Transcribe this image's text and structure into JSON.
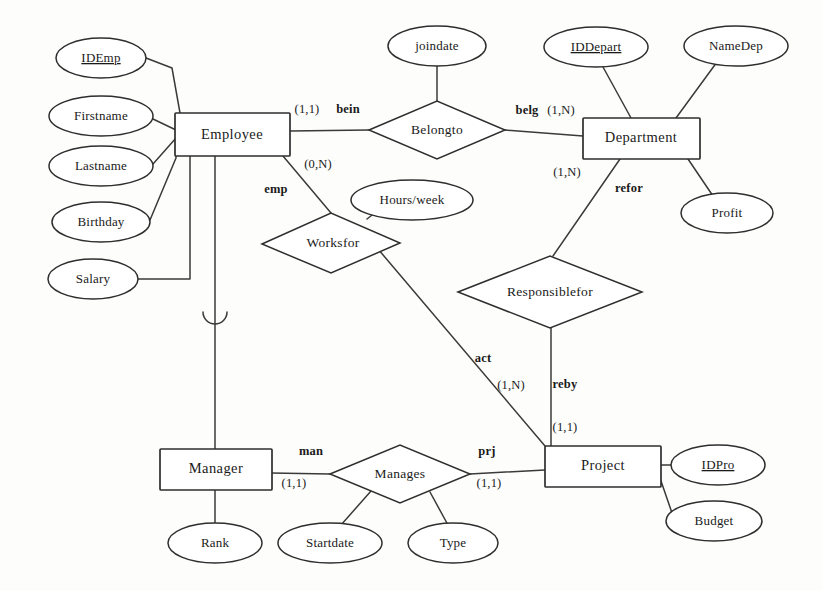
{
  "diagram": {
    "type": "er-diagram",
    "notation": "min-max (Merise style)",
    "entities": [
      {
        "id": "employee",
        "label": "Employee",
        "x": 232,
        "y": 134,
        "w": 116,
        "h": 42
      },
      {
        "id": "department",
        "label": "Department",
        "x": 641,
        "y": 138,
        "w": 117,
        "h": 41
      },
      {
        "id": "manager",
        "label": "Manager",
        "x": 215,
        "y": 469,
        "w": 112,
        "h": 41
      },
      {
        "id": "project",
        "label": "Project",
        "x": 603,
        "y": 466,
        "w": 116,
        "h": 41
      }
    ],
    "relationships": [
      {
        "id": "belongto",
        "label": "Belongto",
        "x": 437,
        "y": 130,
        "rx": 68,
        "ry": 29
      },
      {
        "id": "worksfor",
        "label": "Worksfor",
        "x": 331,
        "y": 243,
        "rx": 69,
        "ry": 30
      },
      {
        "id": "responsiblefor",
        "label": "Responsiblefor",
        "x": 550,
        "y": 292,
        "rx": 92,
        "ry": 36
      },
      {
        "id": "manages",
        "label": "Manages",
        "x": 400,
        "y": 474,
        "rx": 70,
        "ry": 29
      }
    ],
    "attributes": [
      {
        "id": "idemp",
        "label": "IDEmp",
        "key": true,
        "owner": "employee",
        "x": 101,
        "y": 58,
        "rx": 45,
        "ry": 20
      },
      {
        "id": "firstname",
        "label": "Firstname",
        "key": false,
        "owner": "employee",
        "x": 101,
        "y": 116,
        "rx": 52,
        "ry": 20
      },
      {
        "id": "lastname",
        "label": "Lastname",
        "key": false,
        "owner": "employee",
        "x": 101,
        "y": 166,
        "rx": 52,
        "ry": 20
      },
      {
        "id": "birthday",
        "label": "Birthday",
        "key": false,
        "owner": "employee",
        "x": 101,
        "y": 222,
        "rx": 49,
        "ry": 20
      },
      {
        "id": "salary",
        "label": "Salary",
        "key": false,
        "owner": "employee",
        "x": 93,
        "y": 278,
        "rx": 45,
        "ry": 20
      },
      {
        "id": "joindate",
        "label": "joindate",
        "key": false,
        "owner": "belongto",
        "x": 437,
        "y": 46,
        "rx": 49,
        "ry": 20
      },
      {
        "id": "iddepart",
        "label": "IDDepart",
        "key": true,
        "owner": "department",
        "x": 596,
        "y": 47,
        "rx": 52,
        "ry": 20
      },
      {
        "id": "namedep",
        "label": "NameDep",
        "key": false,
        "owner": "department",
        "x": 736,
        "y": 46,
        "rx": 52,
        "ry": 20
      },
      {
        "id": "profit",
        "label": "Profit",
        "key": false,
        "owner": "department",
        "x": 727,
        "y": 212,
        "rx": 46,
        "ry": 20
      },
      {
        "id": "hoursweek",
        "label": "Hours/week",
        "key": false,
        "owner": "worksfor",
        "x": 412,
        "y": 200,
        "rx": 61,
        "ry": 20
      },
      {
        "id": "rank",
        "label": "Rank",
        "key": false,
        "owner": "manager",
        "x": 215,
        "y": 543,
        "rx": 47,
        "ry": 20
      },
      {
        "id": "startdate",
        "label": "Startdate",
        "key": false,
        "owner": "manages",
        "x": 330,
        "y": 543,
        "rx": 52,
        "ry": 20
      },
      {
        "id": "type",
        "label": "Type",
        "key": false,
        "owner": "manages",
        "x": 453,
        "y": 543,
        "rx": 45,
        "ry": 20
      },
      {
        "id": "idpro",
        "label": "IDPro",
        "key": true,
        "owner": "project",
        "x": 718,
        "y": 465,
        "rx": 47,
        "ry": 20
      },
      {
        "id": "budget",
        "label": "Budget",
        "key": false,
        "owner": "project",
        "x": 714,
        "y": 521,
        "rx": 48,
        "ry": 20
      }
    ],
    "role_labels": [
      {
        "id": "bein",
        "label": "bein",
        "x": 348,
        "y": 110
      },
      {
        "id": "belg",
        "label": "belg",
        "x": 527,
        "y": 111
      },
      {
        "id": "emp",
        "label": "emp",
        "x": 276,
        "y": 190
      },
      {
        "id": "refor",
        "label": "refor",
        "x": 629,
        "y": 189
      },
      {
        "id": "act",
        "label": "act",
        "x": 483,
        "y": 359
      },
      {
        "id": "reby",
        "label": "reby",
        "x": 565,
        "y": 385
      },
      {
        "id": "man",
        "label": "man",
        "x": 311,
        "y": 452
      },
      {
        "id": "prj",
        "label": "prj",
        "x": 487,
        "y": 452
      }
    ],
    "cardinalities": [
      {
        "id": "emp-belongto",
        "label": "(1,1)",
        "x": 307,
        "y": 110
      },
      {
        "id": "dept-belongto",
        "label": "(1,N)",
        "x": 561,
        "y": 111
      },
      {
        "id": "emp-worksfor",
        "label": "(0,N)",
        "x": 318,
        "y": 165
      },
      {
        "id": "dept-responsiblefor",
        "label": "(1,N)",
        "x": 567,
        "y": 173
      },
      {
        "id": "proj-worksfor",
        "label": "(1,N)",
        "x": 511,
        "y": 386
      },
      {
        "id": "proj-responsiblefor",
        "label": "(1,1)",
        "x": 565,
        "y": 428
      },
      {
        "id": "mgr-manages",
        "label": "(1,1)",
        "x": 294,
        "y": 484
      },
      {
        "id": "proj-manages",
        "label": "(1,1)",
        "x": 489,
        "y": 484
      }
    ],
    "inheritance": {
      "id": "employee-manager-isa",
      "label": "",
      "from": "employee",
      "to": "manager",
      "x": 215,
      "arc_y": 320
    }
  }
}
